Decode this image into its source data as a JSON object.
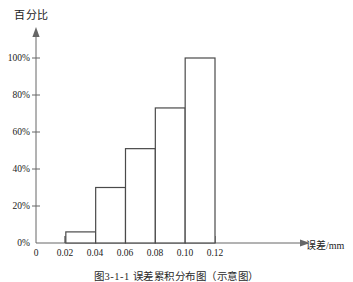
{
  "figure": {
    "caption": "图3-1-1  误差累积分布图（示意图）",
    "y_axis_title": "百分比",
    "x_axis_title": "误差/mm",
    "axis_color": "#555555",
    "bar_outline_color": "#444444",
    "bar_fill_color": "#ffffff",
    "background_color": "#ffffff"
  },
  "chart_data": {
    "type": "bar",
    "title": "图3-1-1  误差累积分布图（示意图）",
    "xlabel": "误差/mm",
    "ylabel": "百分比",
    "categories": [
      "0.02-0.04",
      "0.04-0.06",
      "0.06-0.08",
      "0.08-0.10",
      "0.10-0.12"
    ],
    "bin_edges": [
      0.02,
      0.04,
      0.06,
      0.08,
      0.1,
      0.12
    ],
    "values": [
      6,
      30,
      51,
      73,
      100
    ],
    "value_unit": "%",
    "xlim": [
      0,
      0.13
    ],
    "ylim": [
      0,
      110
    ],
    "x_ticks": [
      0,
      0.02,
      0.04,
      0.06,
      0.08,
      0.1,
      0.12
    ],
    "x_tick_labels": [
      "0",
      "0.02",
      "0.04",
      "0.06",
      "0.08",
      "0.10",
      "0.12"
    ],
    "y_ticks": [
      0,
      20,
      40,
      60,
      80,
      100
    ],
    "y_tick_labels": [
      "0%",
      "20%",
      "40%",
      "60%",
      "80%",
      "100%"
    ],
    "grid": false,
    "legend": "none",
    "series": [
      {
        "name": "累积百分比",
        "values": [
          6,
          30,
          51,
          73,
          100
        ]
      }
    ]
  }
}
